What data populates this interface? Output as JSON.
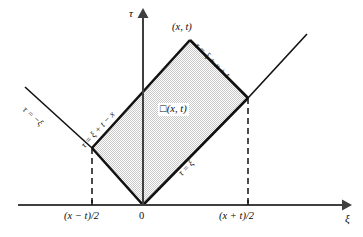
{
  "figure": {
    "type": "characteristic-triangle-diagram",
    "axes": {
      "horizontal_label": "ξ",
      "vertical_label": "τ",
      "origin_label": "0"
    },
    "ticks": [
      {
        "label_prefix": "(",
        "label_var1": "x",
        "label_op": " − ",
        "label_var2": "t",
        "label_suffix": ")/2",
        "text": "(x − t)/2",
        "side": "left"
      },
      {
        "label_prefix": "(",
        "label_var1": "x",
        "label_op": " + ",
        "label_var2": "t",
        "label_suffix": ")/2",
        "text": "(x + t)/2",
        "side": "right"
      }
    ],
    "vertex_label": "(x, t)",
    "region_label_box": "□",
    "region_label_text": "(x, t)",
    "lines": [
      {
        "name": "left-characteristic-outer",
        "label": "τ = −ξ"
      },
      {
        "name": "upper-left-edge",
        "label": "τ = ξ + t − x"
      },
      {
        "name": "upper-right-edge",
        "label": "τ = ξ + x + t"
      },
      {
        "name": "lower-right-edge",
        "label": "τ = ξ"
      }
    ],
    "colors": {
      "stroke": "#111111",
      "axis": "#3a3a3a",
      "fill": "#d8d8d8",
      "background": "#ffffff"
    }
  }
}
